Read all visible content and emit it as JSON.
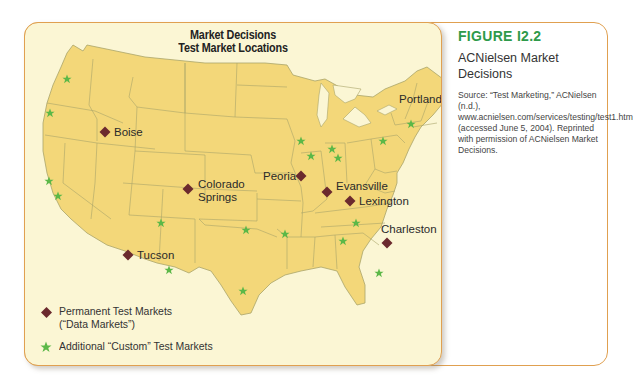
{
  "figure": {
    "label": "FIGURE I2.2",
    "title": "ACNielsen Market Decisions",
    "source": "Source: “Test Marketing,” ACNielsen (n.d.), www.acnielsen.com/services/testing/test1.htm (accessed June 5, 2004). Reprinted with permission of ACNielsen Market Decisions."
  },
  "map": {
    "title_line1": "Market Decisions",
    "title_line2": "Test Market Locations",
    "colors": {
      "land": "#f3d779",
      "border": "#a9a46a",
      "water": "#fbf6d4",
      "permanent_marker": "#6b2a2e",
      "custom_marker": "#5cb848",
      "frame": "#e0a050",
      "figure_label": "#2e9a4a"
    },
    "permanent_markets": [
      {
        "name": "Boise",
        "x": 80,
        "y": 109
      },
      {
        "name": "Colorado",
        "name2": "Springs",
        "x": 163,
        "y": 166
      },
      {
        "name": "Peoria",
        "x": 276,
        "y": 153
      },
      {
        "name": "Evansville",
        "x": 302,
        "y": 169
      },
      {
        "name": "Lexington",
        "x": 325,
        "y": 178
      },
      {
        "name": "Tucson",
        "x": 103,
        "y": 232
      },
      {
        "name": "Charleston",
        "x": 362,
        "y": 220
      },
      {
        "name": "Portland",
        "x": 422,
        "y": 80
      }
    ],
    "custom_markets": [
      {
        "x": 42,
        "y": 56
      },
      {
        "x": 25,
        "y": 90
      },
      {
        "x": 24,
        "y": 158
      },
      {
        "x": 33,
        "y": 173
      },
      {
        "x": 136,
        "y": 200
      },
      {
        "x": 144,
        "y": 247
      },
      {
        "x": 221,
        "y": 207
      },
      {
        "x": 260,
        "y": 211
      },
      {
        "x": 218,
        "y": 268
      },
      {
        "x": 276,
        "y": 118
      },
      {
        "x": 286,
        "y": 133
      },
      {
        "x": 307,
        "y": 126
      },
      {
        "x": 313,
        "y": 135
      },
      {
        "x": 318,
        "y": 218
      },
      {
        "x": 331,
        "y": 200
      },
      {
        "x": 354,
        "y": 250
      },
      {
        "x": 358,
        "y": 118
      },
      {
        "x": 386,
        "y": 101
      }
    ]
  },
  "legend": {
    "permanent_line1": "Permanent Test Markets",
    "permanent_line2": "(“Data Markets”)",
    "custom": "Additional “Custom” Test Markets"
  }
}
